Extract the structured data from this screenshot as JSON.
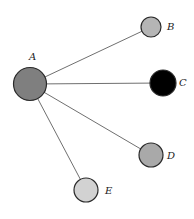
{
  "diagram": {
    "type": "star-graph",
    "center": "A",
    "nodes": [
      {
        "id": "A",
        "label": "A",
        "cx": 30,
        "cy": 84,
        "r": 16.5,
        "fill": "#7f7f7f",
        "lx": 29,
        "ly": 60
      },
      {
        "id": "B",
        "label": "B",
        "cx": 151,
        "cy": 27,
        "r": 10,
        "fill": "#b5b5b5",
        "lx": 167,
        "ly": 30
      },
      {
        "id": "C",
        "label": "C",
        "cx": 163,
        "cy": 83,
        "r": 13,
        "fill": "#000000",
        "lx": 179,
        "ly": 86
      },
      {
        "id": "D",
        "label": "D",
        "cx": 151,
        "cy": 155,
        "r": 12,
        "fill": "#a9a9a9",
        "lx": 167,
        "ly": 159
      },
      {
        "id": "E",
        "label": "E",
        "cx": 86,
        "cy": 190,
        "r": 12,
        "fill": "#d2d2d2",
        "lx": 105,
        "ly": 194
      }
    ],
    "edges": [
      {
        "from": "A",
        "to": "B"
      },
      {
        "from": "A",
        "to": "C"
      },
      {
        "from": "A",
        "to": "D"
      },
      {
        "from": "A",
        "to": "E"
      }
    ]
  }
}
